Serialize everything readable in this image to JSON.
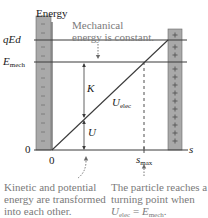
{
  "diagram": {
    "axis_title": "Energy",
    "y_labels": {
      "qEd": "qEd",
      "emech_main": "E",
      "emech_sub": "mech",
      "zero": "0"
    },
    "x_labels": {
      "zero": "0",
      "smax_main": "s",
      "smax_sub": "max",
      "s": "s"
    },
    "curve_labels": {
      "K": "K",
      "U": "U",
      "uelec_main": "U",
      "uelec_sub": "elec"
    },
    "annotations": {
      "top": "Mechanical energy is constant.",
      "bottom_left": "Kinetic and potential energy are transformed into each other.",
      "bottom_right_prefix": "The particle reaches a turning point when ",
      "bottom_right_eq_u": "U",
      "bottom_right_eq_u_sub": "elec",
      "bottom_right_eq_mid": " = ",
      "bottom_right_eq_e": "E",
      "bottom_right_eq_e_sub": "mech",
      "bottom_right_suffix": "."
    },
    "plates": {
      "left_sign": "−",
      "right_sign": "+"
    },
    "colors": {
      "plate_fill": "#a9a9a9",
      "plate_stroke": "#555555",
      "line": "#3a3a3a",
      "note_text": "#7a7a7a",
      "label_text": "#1a1a1a"
    }
  }
}
